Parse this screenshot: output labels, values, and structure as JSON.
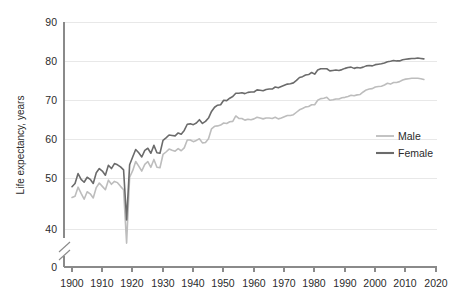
{
  "chart_data": {
    "type": "line",
    "title": "",
    "xlabel": "",
    "ylabel": "Life expectancy, years",
    "xlim": [
      1900,
      2020
    ],
    "ylim": [
      0,
      90
    ],
    "y_axis_break": {
      "below": 40,
      "label": "axis-break-between-0-and-40"
    },
    "grid": "horizontal",
    "legend_position": "right-middle",
    "xticks": [
      1900,
      1910,
      1920,
      1930,
      1940,
      1950,
      1960,
      1970,
      1980,
      1990,
      2000,
      2010,
      2020
    ],
    "yticks": [
      0,
      40,
      50,
      60,
      70,
      80,
      90
    ],
    "x": [
      1900,
      1901,
      1902,
      1903,
      1904,
      1905,
      1906,
      1907,
      1908,
      1909,
      1910,
      1911,
      1912,
      1913,
      1914,
      1915,
      1916,
      1917,
      1918,
      1919,
      1920,
      1921,
      1922,
      1923,
      1924,
      1925,
      1926,
      1927,
      1928,
      1929,
      1930,
      1931,
      1932,
      1933,
      1934,
      1935,
      1936,
      1937,
      1938,
      1939,
      1940,
      1941,
      1942,
      1943,
      1944,
      1945,
      1946,
      1947,
      1948,
      1949,
      1950,
      1951,
      1952,
      1953,
      1954,
      1955,
      1956,
      1957,
      1958,
      1959,
      1960,
      1961,
      1962,
      1963,
      1964,
      1965,
      1966,
      1967,
      1968,
      1969,
      1970,
      1971,
      1972,
      1973,
      1974,
      1975,
      1976,
      1977,
      1978,
      1979,
      1980,
      1981,
      1982,
      1983,
      1984,
      1985,
      1986,
      1987,
      1988,
      1989,
      1990,
      1991,
      1992,
      1993,
      1994,
      1995,
      1996,
      1997,
      1998,
      1999,
      2000,
      2001,
      2002,
      2003,
      2004,
      2005,
      2006,
      2007,
      2008,
      2009,
      2010,
      2011,
      2012,
      2013,
      2014,
      2015,
      2016
    ],
    "series": [
      {
        "name": "Female",
        "color": "#6b6b6b",
        "values": [
          50.2,
          51.0,
          53.4,
          52.0,
          51.3,
          52.5,
          52.0,
          51.0,
          53.6,
          54.6,
          54.0,
          53.0,
          55.4,
          54.6,
          55.8,
          55.5,
          55.0,
          54.3,
          42.2,
          55.5,
          57.4,
          59.2,
          58.4,
          57.4,
          59.0,
          59.5,
          58.3,
          60.2,
          58.4,
          58.3,
          61.4,
          62.0,
          62.7,
          62.6,
          62.5,
          63.2,
          62.9,
          63.8,
          65.3,
          65.4,
          65.2,
          65.6,
          66.4,
          65.5,
          66.0,
          66.8,
          68.4,
          69.4,
          69.9,
          70.0,
          71.1,
          71.0,
          71.6,
          72.0,
          72.8,
          72.8,
          72.9,
          72.7,
          73.0,
          73.1,
          73.1,
          73.6,
          73.5,
          73.4,
          73.7,
          73.8,
          73.8,
          74.3,
          74.1,
          74.4,
          74.7,
          75.0,
          75.1,
          75.3,
          75.9,
          76.6,
          76.8,
          77.2,
          77.3,
          77.8,
          77.4,
          78.4,
          78.7,
          78.7,
          78.7,
          78.2,
          78.3,
          78.4,
          78.3,
          78.5,
          78.8,
          79.0,
          79.1,
          78.8,
          79.0,
          78.9,
          79.1,
          79.4,
          79.5,
          79.4,
          79.7,
          79.8,
          79.9,
          80.1,
          80.4,
          80.5,
          80.7,
          80.6,
          80.6,
          80.9,
          81.0,
          81.1,
          81.2,
          81.2,
          81.3,
          81.2,
          81.1
        ]
      },
      {
        "name": "Male",
        "color": "#bdbdbd",
        "values": [
          47.6,
          47.9,
          50.1,
          48.6,
          47.2,
          49.0,
          48.5,
          47.5,
          50.0,
          51.1,
          50.3,
          49.5,
          51.8,
          50.8,
          51.5,
          51.2,
          50.3,
          49.5,
          36.6,
          52.5,
          54.1,
          56.3,
          55.2,
          54.0,
          55.6,
          56.3,
          54.9,
          56.8,
          54.9,
          54.8,
          58.0,
          58.6,
          59.3,
          59.0,
          58.8,
          59.4,
          58.9,
          59.6,
          61.5,
          61.5,
          61.1,
          61.4,
          61.8,
          60.8,
          60.9,
          61.8,
          64.2,
          64.8,
          64.9,
          65.1,
          65.6,
          65.5,
          65.9,
          66.0,
          67.3,
          66.7,
          66.7,
          66.3,
          66.5,
          66.4,
          66.6,
          67.0,
          66.8,
          66.6,
          66.8,
          66.8,
          66.7,
          67.0,
          66.6,
          66.8,
          67.1,
          67.4,
          67.4,
          67.6,
          68.2,
          68.8,
          69.1,
          69.5,
          69.6,
          70.0,
          70.0,
          71.1,
          71.5,
          71.6,
          71.8,
          71.1,
          71.2,
          71.4,
          71.4,
          71.7,
          71.8,
          72.0,
          72.3,
          72.2,
          72.4,
          72.5,
          73.1,
          73.6,
          73.8,
          73.9,
          74.3,
          74.4,
          74.5,
          74.8,
          75.2,
          75.0,
          75.4,
          75.4,
          75.6,
          76.0,
          76.2,
          76.3,
          76.4,
          76.4,
          76.4,
          76.3,
          76.1
        ]
      }
    ]
  },
  "legend": {
    "entries": [
      {
        "label": "Male",
        "color": "#bdbdbd"
      },
      {
        "label": "Female",
        "color": "#6b6b6b"
      }
    ]
  },
  "axes": {
    "y_title": "Life expectancy, years",
    "y_tick_labels": [
      "90",
      "80",
      "70",
      "60",
      "50",
      "40",
      "0"
    ],
    "x_tick_labels": [
      "1900",
      "1910",
      "1920",
      "1930",
      "1940",
      "1950",
      "1960",
      "1970",
      "1980",
      "1990",
      "2000",
      "2010",
      "2020"
    ]
  }
}
